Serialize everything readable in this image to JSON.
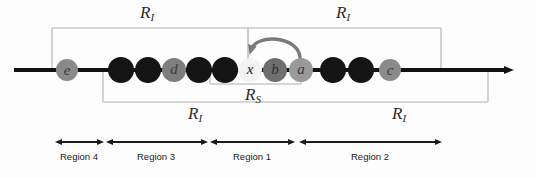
{
  "figure": {
    "background_color": "#fdfdfd",
    "line_color": "#121212",
    "bracket_color": "#c9c9c9",
    "arc_color": "#7a7a7a"
  },
  "brackets": {
    "top_left": {
      "label": "R",
      "subscript": "I",
      "x_start": 52,
      "x_end": 248,
      "label_x": 150,
      "label_y": 8
    },
    "top_right": {
      "label": "R",
      "subscript": "I",
      "x_start": 248,
      "x_end": 441,
      "label_x": 345,
      "label_y": 8
    },
    "inner_small": {
      "label": "R",
      "subscript": "S",
      "x_start": 210,
      "x_end": 300,
      "label_x": 255,
      "label_y": 89
    },
    "bottom_wide": {
      "label": "R",
      "subscript": "I",
      "x_start": 103,
      "x_end": 488,
      "label_x": 196,
      "label_y": 107
    },
    "bottom_wide_right_label": {
      "label": "R",
      "subscript": "I",
      "label_x": 400,
      "label_y": 107
    }
  },
  "axis": {
    "y": 70,
    "x_start": 14,
    "x_end": 516,
    "arrow_head": "right"
  },
  "nodes": [
    {
      "id": "n1",
      "label": "e",
      "cx": 67,
      "fill": "#8a8a8a",
      "text_color": "#3a3a3a",
      "radius": 11
    },
    {
      "id": "n2",
      "label": "",
      "cx": 121,
      "fill": "#141414",
      "text_color": "#141414",
      "radius": 13
    },
    {
      "id": "n3",
      "label": "",
      "cx": 148,
      "fill": "#141414",
      "text_color": "#141414",
      "radius": 13
    },
    {
      "id": "n4",
      "label": "d",
      "cx": 174,
      "fill": "#7d7d7d",
      "text_color": "#3c3c3c",
      "radius": 12
    },
    {
      "id": "n5",
      "label": "",
      "cx": 199,
      "fill": "#141414",
      "text_color": "#141414",
      "radius": 13
    },
    {
      "id": "n6",
      "label": "",
      "cx": 225,
      "fill": "#141414",
      "text_color": "#141414",
      "radius": 13
    },
    {
      "id": "n7",
      "label": "x",
      "cx": 250,
      "fill": "#f3f3f3",
      "text_color": "#1a1a1a",
      "radius": 12
    },
    {
      "id": "n8",
      "label": "b",
      "cx": 275,
      "fill": "#6e6e6e",
      "text_color": "#2e2e2e",
      "radius": 12
    },
    {
      "id": "n9",
      "label": "a",
      "cx": 301,
      "fill": "#9a9a9a",
      "text_color": "#3a3a3a",
      "radius": 12
    },
    {
      "id": "n10",
      "label": "",
      "cx": 333,
      "fill": "#141414",
      "text_color": "#141414",
      "radius": 13
    },
    {
      "id": "n11",
      "label": "",
      "cx": 361,
      "fill": "#141414",
      "text_color": "#141414",
      "radius": 13
    },
    {
      "id": "n12",
      "label": "c",
      "cx": 390,
      "fill": "#8a8a8a",
      "text_color": "#3a3a3a",
      "radius": 11
    }
  ],
  "arc": {
    "from_node": "a",
    "to_node": "x",
    "description": "curved arrow from a to x"
  },
  "regions": [
    {
      "id": "region-4",
      "label": "Region 4",
      "x_start": 55,
      "x_end": 103,
      "label_x": 79,
      "label_y": 157
    },
    {
      "id": "region-3",
      "label": "Region 3",
      "x_start": 106,
      "x_end": 207,
      "label_x": 156,
      "label_y": 157
    },
    {
      "id": "region-1",
      "label": "Region 1",
      "x_start": 210,
      "x_end": 294,
      "label_x": 252,
      "label_y": 157
    },
    {
      "id": "region-2",
      "label": "Region 2",
      "x_start": 299,
      "x_end": 441,
      "label_x": 370,
      "label_y": 157
    }
  ],
  "region_axis": {
    "y": 142
  }
}
